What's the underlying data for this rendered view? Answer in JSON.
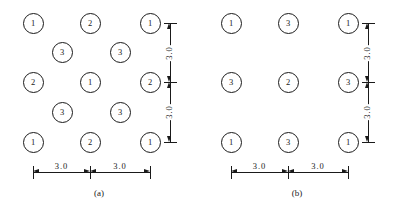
{
  "figure": {
    "panels": [
      {
        "id": "a",
        "caption": "(a)",
        "nodes": [
          {
            "label": "1",
            "x": 33,
            "y": 23
          },
          {
            "label": "2",
            "x": 90,
            "y": 23
          },
          {
            "label": "1",
            "x": 150,
            "y": 23
          },
          {
            "label": "3",
            "x": 62,
            "y": 52
          },
          {
            "label": "3",
            "x": 120,
            "y": 52
          },
          {
            "label": "2",
            "x": 33,
            "y": 82
          },
          {
            "label": "1",
            "x": 90,
            "y": 82
          },
          {
            "label": "2",
            "x": 150,
            "y": 82
          },
          {
            "label": "3",
            "x": 62,
            "y": 112
          },
          {
            "label": "3",
            "x": 120,
            "y": 112
          },
          {
            "label": "1",
            "x": 33,
            "y": 142
          },
          {
            "label": "2",
            "x": 90,
            "y": 142
          },
          {
            "label": "1",
            "x": 150,
            "y": 142
          }
        ],
        "horizontal_dimensions": [
          {
            "value": "3.0",
            "x1": 33,
            "x2": 90
          },
          {
            "value": "3.0",
            "x1": 90,
            "x2": 150
          }
        ],
        "vertical_dimensions": [
          {
            "value": "3.0",
            "y1": 23,
            "y2": 82
          },
          {
            "value": "3.0",
            "y1": 82,
            "y2": 142
          }
        ]
      },
      {
        "id": "b",
        "caption": "(b)",
        "nodes": [
          {
            "label": "1",
            "x": 33,
            "y": 23
          },
          {
            "label": "3",
            "x": 90,
            "y": 23
          },
          {
            "label": "1",
            "x": 150,
            "y": 23
          },
          {
            "label": "3",
            "x": 33,
            "y": 82
          },
          {
            "label": "2",
            "x": 90,
            "y": 82
          },
          {
            "label": "3",
            "x": 150,
            "y": 82
          },
          {
            "label": "1",
            "x": 33,
            "y": 142
          },
          {
            "label": "3",
            "x": 90,
            "y": 142
          },
          {
            "label": "1",
            "x": 150,
            "y": 142
          }
        ],
        "horizontal_dimensions": [
          {
            "value": "3.0",
            "x1": 33,
            "x2": 90
          },
          {
            "value": "3.0",
            "x1": 90,
            "x2": 150
          }
        ],
        "vertical_dimensions": [
          {
            "value": "3.0",
            "y1": 23,
            "y2": 82
          },
          {
            "value": "3.0",
            "y1": 82,
            "y2": 142
          }
        ]
      }
    ],
    "geometry": {
      "dim_baseline_y": 172,
      "dim_axis_x": 170,
      "caption_y": 188
    },
    "colors": {
      "stroke": "#1a1a1a",
      "background": "#ffffff"
    }
  }
}
